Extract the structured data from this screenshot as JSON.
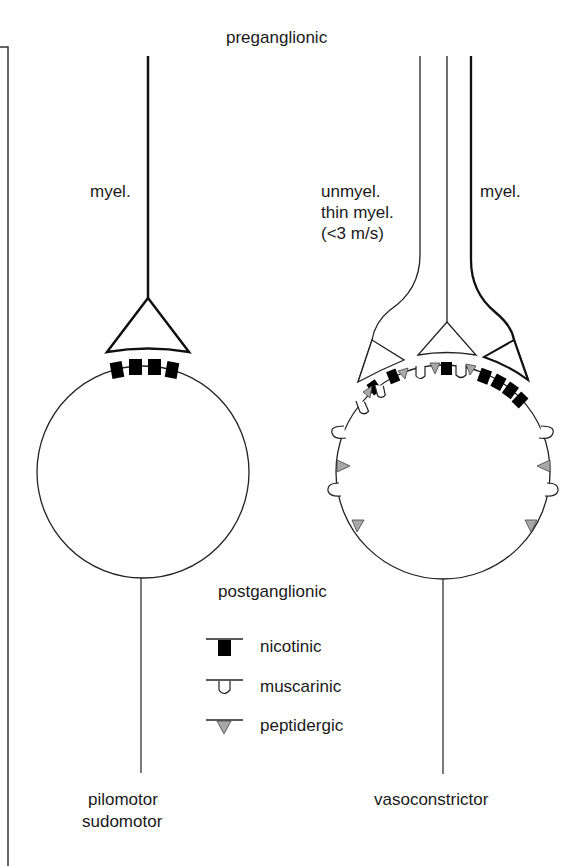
{
  "labels": {
    "preganglionic": "preganglionic",
    "left_myel": "myel.",
    "right_unmyel_line1": "unmyel.",
    "right_unmyel_line2": "thin myel.",
    "right_unmyel_line3": "(<3 m/s)",
    "right_myel": "myel.",
    "postganglionic": "postganglionic",
    "left_target_line1": "pilomotor",
    "left_target_line2": "sudomotor",
    "right_target": "vasoconstrictor"
  },
  "legend": {
    "items": [
      {
        "symbol": "nicotinic-receptor",
        "label": "nicotinic"
      },
      {
        "symbol": "muscarinic-receptor",
        "label": "muscarinic"
      },
      {
        "symbol": "peptidergic-receptor",
        "label": "peptidergic"
      }
    ]
  },
  "colors": {
    "line": "#1a1a1a",
    "nicotinic_fill": "#000000",
    "peptidergic_fill": "#a8a8a8"
  }
}
